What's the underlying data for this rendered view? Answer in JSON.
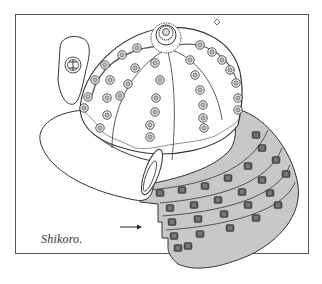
{
  "figure": {
    "caption": "Shikoro.",
    "pointer": "arrow-right",
    "colors": {
      "line": "#333333",
      "shikoro_fill": "#c8c8c8",
      "lacing": "#555555",
      "background": "#ffffff",
      "frame": "#555555"
    }
  }
}
